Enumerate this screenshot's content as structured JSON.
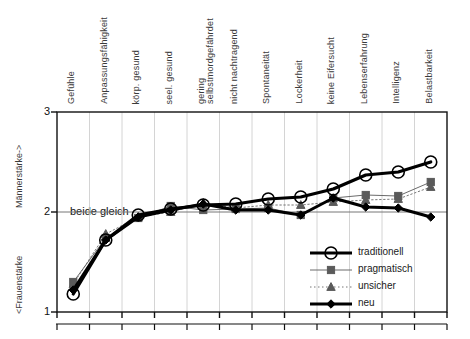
{
  "axes": {
    "y_upper_label": "Männerstärke->",
    "y_lower_label": "<Frauenstärke",
    "y_ticks": [
      "3",
      "2",
      "1"
    ],
    "midline_label": "beide gleich"
  },
  "legend": {
    "items": [
      {
        "label": "traditionell",
        "marker": "circle",
        "style": "thick-solid",
        "color": "#000000"
      },
      {
        "label": "pragmatisch",
        "marker": "square",
        "style": "thin-solid",
        "color": "#555555"
      },
      {
        "label": "unsicher",
        "marker": "triangle",
        "style": "dotted",
        "color": "#666666"
      },
      {
        "label": "neu",
        "marker": "diamond",
        "style": "thick-solid",
        "color": "#000000"
      }
    ]
  },
  "chart_data": {
    "type": "line",
    "title": "",
    "xlabel": "",
    "ylabel": "Männerstärke-> / <Frauenstärke",
    "ylim": [
      1,
      3
    ],
    "yticks": [
      1,
      2,
      3
    ],
    "grid": true,
    "legend_position": "bottom-right",
    "annotations": [
      {
        "text": "beide gleich",
        "y": 2
      }
    ],
    "categories": [
      "Gefühle",
      "Anpassungsfähigkeit",
      "körp. gesund",
      "seel. gesund",
      "gering selbstmordgefährdet",
      "nicht nachtragend",
      "Spontaneität",
      "Lockerheit",
      "keine Eifersucht",
      "Lebenserfahrung",
      "Intelligenz",
      "Belastbarkeit"
    ],
    "series": [
      {
        "name": "traditionell",
        "values": [
          1.18,
          1.72,
          1.97,
          2.03,
          2.07,
          2.08,
          2.13,
          2.15,
          2.23,
          2.37,
          2.4,
          2.5
        ]
      },
      {
        "name": "pragmatisch",
        "values": [
          1.3,
          1.74,
          1.94,
          2.06,
          2.02,
          2.03,
          2.04,
          1.97,
          2.14,
          2.17,
          2.16,
          2.3
        ]
      },
      {
        "name": "unsicher",
        "values": [
          1.28,
          1.78,
          1.95,
          2.0,
          2.09,
          2.04,
          2.07,
          2.07,
          2.1,
          2.12,
          2.13,
          2.25
        ]
      },
      {
        "name": "neu",
        "values": [
          1.22,
          1.72,
          1.95,
          2.02,
          2.08,
          2.02,
          2.02,
          1.97,
          2.14,
          2.05,
          2.04,
          1.95
        ]
      }
    ]
  }
}
